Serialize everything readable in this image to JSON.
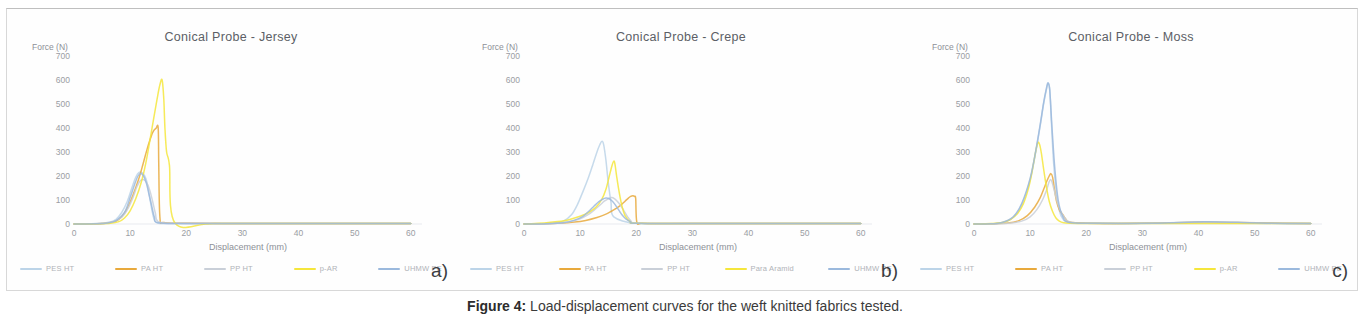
{
  "caption": {
    "label": "Figure 4:",
    "text": " Load-displacement curves for the weft knitted fabrics tested."
  },
  "axes": {
    "ylabel": "Force (N)",
    "xlabel": "Displacement (mm)",
    "yticks": [
      "700",
      "600",
      "500",
      "400",
      "300",
      "200",
      "100",
      "0"
    ],
    "xticks": [
      "0",
      "10",
      "20",
      "30",
      "40",
      "50",
      "60"
    ]
  },
  "colors": {
    "pes_ht": "#bcd4e8",
    "pa_ht": "#e8a93c",
    "pp_ht": "#c9cfd8",
    "p_ar": "#f5e63c",
    "uhmw_pe": "#9bb9dd",
    "axis": "#9a9da3",
    "title": "#5c5f66"
  },
  "panels": [
    {
      "letter": "a)",
      "title": "Conical Probe - Jersey",
      "legend": [
        {
          "label": "PES HT",
          "color": "#bcd4e8"
        },
        {
          "label": "PA HT",
          "color": "#e8a93c"
        },
        {
          "label": "PP HT",
          "color": "#c9cfd8"
        },
        {
          "label": "p-AR",
          "color": "#f5e63c"
        },
        {
          "label": "UHMW PE",
          "color": "#9bb9dd"
        }
      ]
    },
    {
      "letter": "b)",
      "title": "Conical Probe - Crepe",
      "legend": [
        {
          "label": "PES HT",
          "color": "#bcd4e8"
        },
        {
          "label": "PA HT",
          "color": "#e8a93c"
        },
        {
          "label": "PP HT",
          "color": "#c9cfd8"
        },
        {
          "label": "Para Aramid",
          "color": "#f5e63c"
        },
        {
          "label": "UHMW PE",
          "color": "#9bb9dd"
        }
      ]
    },
    {
      "letter": "c)",
      "title": "Conical Probe - Moss",
      "legend": [
        {
          "label": "PES HT",
          "color": "#bcd4e8"
        },
        {
          "label": "PA HT",
          "color": "#e8a93c"
        },
        {
          "label": "PP HT",
          "color": "#c9cfd8"
        },
        {
          "label": "p-AR",
          "color": "#f5e63c"
        },
        {
          "label": "UHMW PE",
          "color": "#9bb9dd"
        }
      ]
    }
  ],
  "chart_data": [
    {
      "type": "line",
      "title": "Conical Probe - Jersey",
      "xlabel": "Displacement (mm)",
      "ylabel": "Force (N)",
      "xlim": [
        0,
        62
      ],
      "ylim": [
        0,
        700
      ],
      "grid": false,
      "legend_position": "bottom",
      "series": [
        {
          "name": "PES HT",
          "color": "#bcd4e8",
          "x": [
            0,
            3,
            5,
            6.5,
            7.5,
            8.5,
            9.5,
            10.3,
            11.0,
            11.6,
            12.2,
            12.8,
            13.2,
            13.6,
            14.0,
            14.4,
            15,
            17,
            22,
            30,
            40,
            50,
            60
          ],
          "y": [
            0,
            1,
            3,
            8,
            20,
            48,
            95,
            150,
            195,
            215,
            212,
            190,
            150,
            95,
            45,
            12,
            3,
            2,
            2,
            2,
            2,
            2,
            2
          ]
        },
        {
          "name": "PA HT",
          "color": "#e8a93c",
          "x": [
            0,
            4,
            6,
            7.5,
            8.5,
            9.5,
            10.5,
            11.5,
            12.3,
            13.0,
            13.6,
            14.1,
            14.6,
            15.0,
            15.1,
            15.3,
            16,
            20,
            30,
            40,
            50,
            60
          ],
          "y": [
            0,
            1,
            4,
            12,
            30,
            65,
            120,
            185,
            250,
            310,
            355,
            385,
            398,
            400,
            250,
            30,
            6,
            3,
            2,
            2,
            2,
            2
          ]
        },
        {
          "name": "PP HT",
          "color": "#c9cfd8",
          "x": [
            0,
            3,
            5,
            7,
            8.5,
            9.5,
            10.5,
            11.2,
            11.8,
            12.4,
            13.0,
            13.5,
            14.0,
            14.5,
            15,
            18,
            25,
            35,
            45,
            55,
            60
          ],
          "y": [
            0,
            1,
            3,
            10,
            28,
            60,
            110,
            155,
            180,
            185,
            170,
            140,
            95,
            45,
            10,
            3,
            2,
            2,
            2,
            2,
            2
          ]
        },
        {
          "name": "p-AR",
          "color": "#f5e63c",
          "x": [
            0,
            4,
            6.5,
            8,
            9,
            10,
            11,
            12,
            12.8,
            13.5,
            14.2,
            14.8,
            15.3,
            15.7,
            16.0,
            16.2,
            16.5,
            17,
            18,
            25,
            40,
            55,
            60
          ],
          "y": [
            0,
            1,
            3,
            10,
            25,
            55,
            105,
            175,
            255,
            345,
            440,
            520,
            580,
            600,
            520,
            400,
            300,
            245,
            4,
            2,
            2,
            2,
            2
          ]
        },
        {
          "name": "UHMW PE",
          "color": "#9bb9dd",
          "x": [
            0,
            4,
            6,
            7.5,
            9,
            10,
            10.8,
            11.4,
            11.9,
            12.4,
            12.9,
            13.3,
            13.8,
            14.3,
            15,
            20,
            30,
            40,
            50,
            60
          ],
          "y": [
            0,
            1,
            4,
            14,
            48,
            110,
            165,
            200,
            210,
            200,
            170,
            130,
            80,
            30,
            5,
            2,
            2,
            2,
            2,
            2
          ]
        }
      ]
    },
    {
      "type": "line",
      "title": "Conical Probe - Crepe",
      "xlabel": "Displacement (mm)",
      "ylabel": "Force (N)",
      "xlim": [
        0,
        62
      ],
      "ylim": [
        0,
        700
      ],
      "grid": false,
      "legend_position": "bottom",
      "series": [
        {
          "name": "PES HT",
          "color": "#bcd4e8",
          "x": [
            0,
            3,
            5,
            7,
            8.5,
            9.5,
            10.5,
            11.5,
            12.3,
            13.0,
            13.5,
            13.9,
            14.2,
            14.6,
            15.0,
            15.5,
            16,
            20,
            30,
            45,
            60
          ],
          "y": [
            0,
            1,
            3,
            12,
            40,
            80,
            135,
            195,
            250,
            300,
            330,
            345,
            330,
            265,
            175,
            90,
            30,
            3,
            2,
            2,
            2
          ]
        },
        {
          "name": "PA HT",
          "color": "#e8a93c",
          "x": [
            0,
            3,
            6,
            9,
            11,
            13,
            14.5,
            15.5,
            16.5,
            17.3,
            18.0,
            18.6,
            19.0,
            19.4,
            19.7,
            19.9,
            20.1,
            21,
            25,
            35,
            50,
            60
          ],
          "y": [
            0,
            1,
            3,
            8,
            15,
            27,
            40,
            52,
            66,
            80,
            95,
            108,
            115,
            118,
            115,
            105,
            8,
            3,
            2,
            2,
            2,
            2
          ]
        },
        {
          "name": "PP HT",
          "color": "#c9cfd8",
          "x": [
            0,
            3,
            6,
            8,
            10,
            11.5,
            12.5,
            13.5,
            14.3,
            15.0,
            15.6,
            16.1,
            16.6,
            17.2,
            17.8,
            18.4,
            19,
            20,
            28,
            40,
            55,
            60
          ],
          "y": [
            0,
            1,
            3,
            9,
            22,
            40,
            58,
            78,
            95,
            105,
            110,
            106,
            95,
            78,
            55,
            32,
            14,
            4,
            2,
            2,
            2,
            2
          ]
        },
        {
          "name": "Para Aramid",
          "color": "#f5e63c",
          "x": [
            0,
            2,
            4,
            6,
            8,
            10,
            11.5,
            12.8,
            13.8,
            14.6,
            15.2,
            15.7,
            16.0,
            16.2,
            16.5,
            16.9,
            17.4,
            18,
            19,
            20,
            30,
            45,
            60
          ],
          "y": [
            0,
            2,
            5,
            10,
            18,
            32,
            48,
            70,
            100,
            145,
            200,
            245,
            262,
            250,
            200,
            140,
            80,
            35,
            8,
            3,
            2,
            2,
            2
          ]
        },
        {
          "name": "UHMW PE",
          "color": "#9bb9dd",
          "x": [
            0,
            4,
            7,
            9,
            10.5,
            11.5,
            12.5,
            13.3,
            14.0,
            14.6,
            15.1,
            15.6,
            16.1,
            16.6,
            17.1,
            17.6,
            18.2,
            19,
            20,
            30,
            45,
            60
          ],
          "y": [
            0,
            1,
            5,
            16,
            32,
            52,
            75,
            92,
            103,
            108,
            106,
            98,
            85,
            68,
            50,
            34,
            20,
            9,
            3,
            2,
            2,
            2
          ]
        }
      ]
    },
    {
      "type": "line",
      "title": "Conical Probe - Moss",
      "xlabel": "Displacement (mm)",
      "ylabel": "Force (N)",
      "xlim": [
        0,
        62
      ],
      "ylim": [
        0,
        700
      ],
      "grid": false,
      "legend_position": "bottom",
      "series": [
        {
          "name": "PES HT",
          "color": "#bcd4e8",
          "x": [
            0,
            3,
            5,
            7,
            8.5,
            10,
            11,
            11.8,
            12.4,
            12.9,
            13.2,
            13.5,
            13.8,
            14.2,
            14.8,
            15.5,
            17,
            22,
            30,
            40,
            46,
            50,
            60
          ],
          "y": [
            0,
            1,
            5,
            28,
            80,
            185,
            300,
            410,
            500,
            560,
            585,
            560,
            420,
            250,
            110,
            35,
            6,
            3,
            3,
            8,
            6,
            3,
            2
          ]
        },
        {
          "name": "PA HT",
          "color": "#e8a93c",
          "x": [
            0,
            3,
            6,
            8,
            9.5,
            10.8,
            11.8,
            12.5,
            13.0,
            13.4,
            13.7,
            14.0,
            14.3,
            14.7,
            15.2,
            15.8,
            16.3,
            17,
            20,
            30,
            40,
            47,
            55,
            60
          ],
          "y": [
            0,
            1,
            4,
            14,
            35,
            70,
            110,
            150,
            180,
            200,
            210,
            195,
            150,
            95,
            60,
            40,
            22,
            8,
            3,
            3,
            7,
            6,
            3,
            2
          ]
        },
        {
          "name": "PP HT",
          "color": "#c9cfd8",
          "x": [
            0,
            3,
            6,
            8.5,
            10,
            11.2,
            12.2,
            12.9,
            13.3,
            13.6,
            13.9,
            14.3,
            14.8,
            15.4,
            16.2,
            17,
            20,
            30,
            42,
            50,
            60
          ],
          "y": [
            0,
            1,
            3,
            12,
            30,
            60,
            100,
            140,
            170,
            185,
            175,
            140,
            95,
            55,
            25,
            9,
            3,
            3,
            6,
            4,
            2
          ]
        },
        {
          "name": "p-AR",
          "color": "#f5e63c",
          "x": [
            0,
            3,
            5,
            6.5,
            7.8,
            8.8,
            9.6,
            10.2,
            10.7,
            11.1,
            11.4,
            11.7,
            12.0,
            12.4,
            12.9,
            13.4,
            14.0,
            14.6,
            15.2,
            16,
            17,
            20,
            30,
            45,
            60
          ],
          "y": [
            0,
            2,
            6,
            18,
            45,
            85,
            140,
            200,
            265,
            315,
            340,
            330,
            295,
            230,
            155,
            95,
            52,
            25,
            12,
            5,
            3,
            2,
            2,
            2,
            2
          ]
        },
        {
          "name": "UHMW PE",
          "color": "#9bb9dd",
          "x": [
            0,
            3,
            5,
            7,
            8.5,
            10,
            11,
            11.8,
            12.4,
            12.9,
            13.2,
            13.5,
            13.9,
            14.4,
            15.0,
            15.8,
            17,
            22,
            32,
            41,
            47,
            52,
            60
          ],
          "y": [
            0,
            1,
            6,
            30,
            85,
            190,
            305,
            415,
            505,
            565,
            588,
            555,
            400,
            230,
            100,
            32,
            6,
            3,
            3,
            9,
            7,
            3,
            2
          ]
        }
      ]
    }
  ]
}
